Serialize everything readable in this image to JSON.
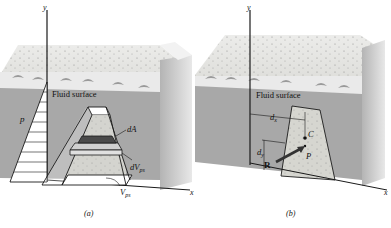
{
  "figure": {
    "panels": [
      {
        "id": "a",
        "caption": "(a)",
        "labels": {
          "y_axis": "y",
          "x_axis": "x",
          "fluid_surface": "Fluid surface",
          "pressure": "p",
          "dA": "dA",
          "dV_main": "dV",
          "dV_sub": "ps",
          "V_main": "V",
          "V_sub": "ps"
        }
      },
      {
        "id": "b",
        "caption": "(b)",
        "labels": {
          "y_axis": "y",
          "x_axis": "x",
          "fluid_surface": "Fluid surface",
          "dx_main": "d",
          "dx_sub": "x",
          "dy_main": "d",
          "dy_sub": "y",
          "centroid": "C",
          "center_of_pressure": "P",
          "resultant": "R"
        }
      }
    ],
    "colors": {
      "concrete_top": "#e4e4e0",
      "fluid_front": "#a9a9a9",
      "fluid_side": "#bdbdbd",
      "plate": "#d6d6d0",
      "line": "#1a1a1a"
    }
  }
}
